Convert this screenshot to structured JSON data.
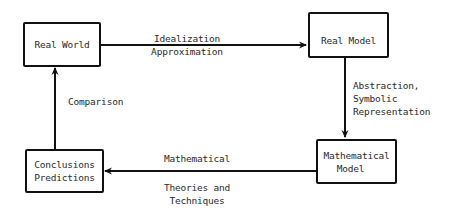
{
  "diagram": {
    "type": "flowchart-cycle",
    "nodes": [
      {
        "id": "real_world",
        "lines": [
          "Real World"
        ]
      },
      {
        "id": "real_model",
        "lines": [
          "Real Model"
        ]
      },
      {
        "id": "mathematical_model",
        "lines": [
          "Mathematical",
          "Model"
        ]
      },
      {
        "id": "conclusions_predictions",
        "lines": [
          "Conclusions",
          "Predictions"
        ]
      }
    ],
    "edges": [
      {
        "from": "real_world",
        "to": "real_model",
        "label_lines": [
          "Idealization",
          "Approximation"
        ]
      },
      {
        "from": "real_model",
        "to": "mathematical_model",
        "label_lines": [
          "Abstraction,",
          "Symbolic",
          "Representation"
        ]
      },
      {
        "from": "mathematical_model",
        "to": "conclusions_predictions",
        "label_above": "Mathematical",
        "label_below_lines": [
          "Theories and",
          "Techniques"
        ]
      },
      {
        "from": "conclusions_predictions",
        "to": "real_world",
        "label_lines": [
          "Comparison"
        ]
      }
    ],
    "colors": {
      "stroke": "#111111",
      "text": "#2a2a2a",
      "background": "#ffffff"
    }
  }
}
